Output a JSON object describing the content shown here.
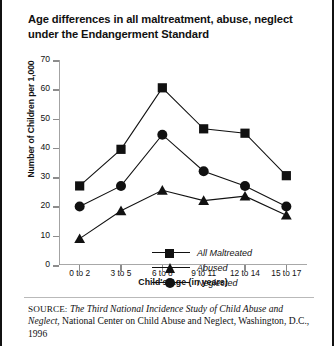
{
  "figure": {
    "title": "Age differences in all maltreatment, abuse, neglect under the Endangerment Standard",
    "source_lead": "SOURCE:",
    "source_title": "The Third National Incidence Study of Child Abuse and Neglect",
    "source_rest": ", National Center on Child Abuse and Neglect, Washington, D.C., 1996"
  },
  "chart_data": {
    "type": "line",
    "title": "Age differences in all maltreatment, abuse, neglect under the Endangerment Standard",
    "xlabel": "Child's Age (in years)",
    "ylabel": "Number of Children per 1,000",
    "categories": [
      "0 to 2",
      "3 to 5",
      "6 to 8",
      "9 to 11",
      "12 to 14",
      "15 to 17"
    ],
    "ylim": [
      0,
      70
    ],
    "yticks": [
      0,
      10,
      20,
      30,
      40,
      50,
      60,
      70
    ],
    "grid": false,
    "legend_position": "inside-center",
    "series": [
      {
        "name": "All Maltreated",
        "marker": "square",
        "color": "#111111",
        "values": [
          27,
          39.5,
          60.5,
          46.5,
          45,
          30.5
        ]
      },
      {
        "name": "Abused",
        "marker": "triangle",
        "color": "#111111",
        "values": [
          9,
          18.5,
          25.5,
          22,
          23.5,
          17
        ]
      },
      {
        "name": "Neglected",
        "marker": "circle",
        "color": "#111111",
        "values": [
          20,
          27,
          44.5,
          32,
          27,
          20
        ]
      }
    ]
  }
}
